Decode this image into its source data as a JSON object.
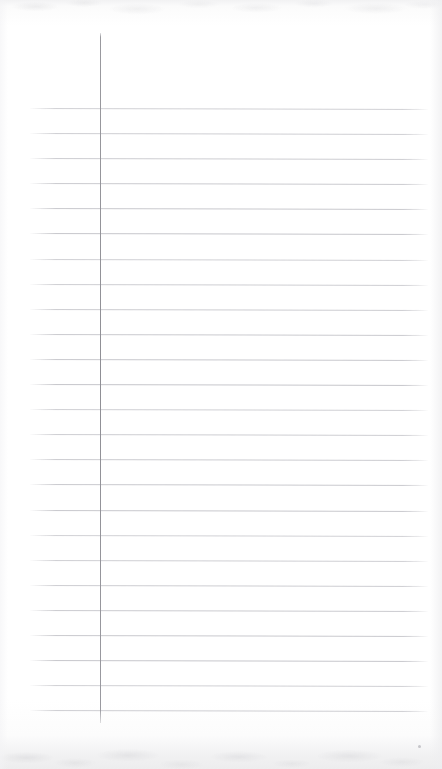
{
  "document": {
    "type": "scanned-ruled-paper",
    "title": "",
    "written_content": "",
    "is_blank": true,
    "page_width": 442,
    "page_height": 769,
    "background_color": "#fefefe",
    "paper_tone": "#ffffff"
  },
  "ruling": {
    "style": "college-ruled-lined-paper",
    "line_color": "#c6c6cb",
    "first_line_y": 108,
    "line_spacing": 25.1,
    "line_count": 25,
    "line_left_x": 30,
    "line_right_x": 428,
    "line_thickness": 1,
    "skew_degrees": 0.13,
    "line_positions_y": [
      108,
      133,
      158,
      183,
      208,
      233,
      259,
      284,
      309,
      334,
      359,
      384,
      409,
      434,
      459,
      484,
      510,
      535,
      560,
      585,
      610,
      635,
      660,
      685,
      710
    ]
  },
  "margin_rule": {
    "orientation": "vertical",
    "color": "#92929a",
    "x": 100,
    "top_y": 33,
    "bottom_y": 723,
    "thickness": 1.4
  },
  "scan_artifacts": {
    "top_band_height": 30,
    "bottom_band_height": 38,
    "edge_shade_color": "#eeeef0",
    "speck": {
      "x": 418,
      "y": 745,
      "size": 3,
      "color": "#96969e"
    }
  },
  "accessibility": {
    "description": "Blank scanned sheet of lined notebook paper with a vertical margin rule and horizontal ruled lines; no handwriting or printed text present."
  }
}
